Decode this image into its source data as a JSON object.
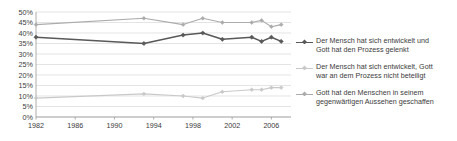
{
  "chart_data": {
    "type": "line",
    "title": "",
    "subtitle": "",
    "xlabel": "",
    "ylabel": "",
    "xlim": [
      1982,
      2008
    ],
    "ylim": [
      0,
      50
    ],
    "ytick_values": [
      0,
      5,
      10,
      15,
      20,
      25,
      30,
      35,
      40,
      45,
      50
    ],
    "ytick_labels": [
      "0%",
      "5%",
      "10%",
      "15%",
      "20%",
      "25%",
      "30%",
      "35%",
      "40%",
      "45%",
      "50%"
    ],
    "xtick_values": [
      1982,
      1986,
      1990,
      1994,
      1998,
      2002,
      2006
    ],
    "xtick_labels": [
      "1982",
      "1986",
      "1990",
      "1994",
      "1998",
      "2002",
      "2006"
    ],
    "grid": true,
    "grid_axis": "y",
    "legend_position": "right",
    "markers": "cross-diamond",
    "series": [
      {
        "name": "Der Mensch hat sich entwickelt und\nGott hat den Prozess gelenkt",
        "color": "#595959",
        "points": [
          {
            "x": 1982,
            "y": 38
          },
          {
            "x": 1993,
            "y": 35
          },
          {
            "x": 1997,
            "y": 39
          },
          {
            "x": 1999,
            "y": 40
          },
          {
            "x": 2001,
            "y": 37
          },
          {
            "x": 2004,
            "y": 38
          },
          {
            "x": 2005,
            "y": 36
          },
          {
            "x": 2006,
            "y": 38
          },
          {
            "x": 2007,
            "y": 36
          }
        ]
      },
      {
        "name": "Der Mensch hat sich entwickelt,  Gott\nwar an dem Prozess nicht beteiligt",
        "color": "#c9c9c9",
        "points": [
          {
            "x": 1982,
            "y": 9
          },
          {
            "x": 1993,
            "y": 11
          },
          {
            "x": 1997,
            "y": 10
          },
          {
            "x": 1999,
            "y": 9
          },
          {
            "x": 2001,
            "y": 12
          },
          {
            "x": 2004,
            "y": 13
          },
          {
            "x": 2005,
            "y": 13
          },
          {
            "x": 2006,
            "y": 14
          },
          {
            "x": 2007,
            "y": 14
          }
        ]
      },
      {
        "name": "Gott hat den Menschen in seinem\ngegenwärtigen Aussehen geschaffen",
        "color": "#ababab",
        "points": [
          {
            "x": 1982,
            "y": 44
          },
          {
            "x": 1993,
            "y": 47
          },
          {
            "x": 1997,
            "y": 44
          },
          {
            "x": 1999,
            "y": 47
          },
          {
            "x": 2001,
            "y": 45
          },
          {
            "x": 2004,
            "y": 45
          },
          {
            "x": 2005,
            "y": 46
          },
          {
            "x": 2006,
            "y": 43
          },
          {
            "x": 2007,
            "y": 44
          }
        ]
      }
    ]
  },
  "legend": {
    "items": [
      {
        "label": "Der Mensch hat sich entwickelt und\nGott hat den Prozess gelenkt",
        "color": "#595959",
        "marker": "line-marker-icon"
      },
      {
        "label": "Der Mensch hat sich entwickelt,  Gott\nwar an dem Prozess nicht beteiligt",
        "color": "#c9c9c9",
        "marker": "line-marker-icon"
      },
      {
        "label": "Gott hat den Menschen in seinem\ngegenwärtigen Aussehen geschaffen",
        "color": "#ababab",
        "marker": "line-marker-icon"
      }
    ]
  },
  "axes": {
    "grid_color": "#d9d9d9",
    "axis_color": "#9a9a9a",
    "tick_text_color": "#3b3b3b"
  }
}
